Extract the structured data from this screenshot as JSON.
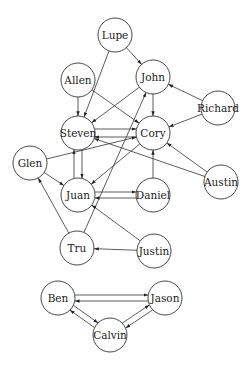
{
  "diagram": {
    "type": "directed-graph",
    "node_radius": 17,
    "nodes": [
      {
        "id": "Lupe",
        "label": "Lupe",
        "x": 115,
        "y": 35
      },
      {
        "id": "Allen",
        "label": "Allen",
        "x": 78,
        "y": 80
      },
      {
        "id": "John",
        "label": "John",
        "x": 153,
        "y": 77
      },
      {
        "id": "Richard",
        "label": "Richard",
        "x": 218,
        "y": 108
      },
      {
        "id": "Steven",
        "label": "Steven",
        "x": 78,
        "y": 133
      },
      {
        "id": "Cory",
        "label": "Cory",
        "x": 153,
        "y": 133
      },
      {
        "id": "Glen",
        "label": "Glen",
        "x": 30,
        "y": 163
      },
      {
        "id": "Austin",
        "label": "Austin",
        "x": 221,
        "y": 182
      },
      {
        "id": "Juan",
        "label": "Juan",
        "x": 78,
        "y": 195
      },
      {
        "id": "Daniel",
        "label": "Daniel",
        "x": 153,
        "y": 195
      },
      {
        "id": "Tru",
        "label": "Tru",
        "x": 77,
        "y": 248
      },
      {
        "id": "Justin",
        "label": "Justin",
        "x": 154,
        "y": 251
      },
      {
        "id": "Ben",
        "label": "Ben",
        "x": 58,
        "y": 298
      },
      {
        "id": "Jason",
        "label": "Jason",
        "x": 165,
        "y": 298
      },
      {
        "id": "Calvin",
        "label": "Calvin",
        "x": 110,
        "y": 335
      }
    ],
    "edges": [
      {
        "from": "Lupe",
        "to": "John"
      },
      {
        "from": "Lupe",
        "to": "Steven"
      },
      {
        "from": "Allen",
        "to": "Steven"
      },
      {
        "from": "Allen",
        "to": "Cory"
      },
      {
        "from": "John",
        "to": "Steven"
      },
      {
        "from": "John",
        "to": "Cory"
      },
      {
        "from": "Richard",
        "to": "John"
      },
      {
        "from": "Richard",
        "to": "Cory"
      },
      {
        "from": "Steven",
        "to": "Cory",
        "offset": -4
      },
      {
        "from": "Cory",
        "to": "Steven",
        "offset": -4
      },
      {
        "from": "Steven",
        "to": "Juan",
        "offset": -4
      },
      {
        "from": "Juan",
        "to": "Steven",
        "offset": -4
      },
      {
        "from": "Glen",
        "to": "Cory"
      },
      {
        "from": "Glen",
        "to": "Juan"
      },
      {
        "from": "Cory",
        "to": "Juan"
      },
      {
        "from": "Austin",
        "to": "Cory"
      },
      {
        "from": "Austin",
        "to": "Steven"
      },
      {
        "from": "Daniel",
        "to": "Cory"
      },
      {
        "from": "Daniel",
        "to": "Juan",
        "offset": -3
      },
      {
        "from": "Juan",
        "to": "Daniel",
        "offset": -3
      },
      {
        "from": "Tru",
        "to": "Glen"
      },
      {
        "from": "Tru",
        "to": "John"
      },
      {
        "from": "Justin",
        "to": "Tru"
      },
      {
        "from": "Justin",
        "to": "Juan"
      },
      {
        "from": "Jason",
        "to": "Ben",
        "offset": -3
      },
      {
        "from": "Ben",
        "to": "Jason",
        "offset": -3
      },
      {
        "from": "Calvin",
        "to": "Ben",
        "offset": -3
      },
      {
        "from": "Ben",
        "to": "Calvin",
        "offset": -3
      },
      {
        "from": "Calvin",
        "to": "Jason",
        "offset": -3
      },
      {
        "from": "Jason",
        "to": "Calvin",
        "offset": -3
      }
    ]
  }
}
